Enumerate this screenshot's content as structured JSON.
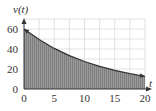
{
  "chart_data": {
    "type": "area",
    "title": "",
    "xlabel": "t",
    "ylabel": "v(t)",
    "xlim": [
      0,
      20
    ],
    "ylim": [
      0,
      60
    ],
    "x_ticks": [
      0,
      5,
      10,
      15,
      20
    ],
    "y_ticks": [
      0,
      20,
      40,
      60
    ],
    "x_tick_labels": [
      "0",
      "5",
      "10",
      "15",
      "20"
    ],
    "y_tick_labels": [
      "0",
      "20",
      "40",
      "60"
    ],
    "grid": true,
    "grid_x_step": 2.5,
    "grid_y_step": 10,
    "series": [
      {
        "name": "v(t)",
        "x": [
          0,
          2.5,
          5,
          7.5,
          10,
          12.5,
          15,
          17.5,
          20
        ],
        "values": [
          60,
          49.4,
          40.6,
          33.4,
          27.5,
          22.7,
          18.6,
          15.3,
          12.6
        ],
        "shaded_under": true
      }
    ],
    "curve_arrows": "both ends",
    "colors": {
      "fill": "#8a8a8a",
      "line": "#333333",
      "grid": "#d9d9d9"
    }
  },
  "labels": {
    "y_axis": "v(t)",
    "x_axis": "t"
  }
}
